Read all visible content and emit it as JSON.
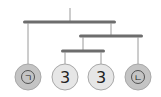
{
  "diagram": {
    "type": "hanging-mobile-balance",
    "colors": {
      "bar": "#6d6d6d",
      "string": "#9a9a9a",
      "ball_shaded": "#bfbfbf",
      "ball_light": "#e6e6e6",
      "ball_stroke": "#a8a8a8",
      "text": "#222222"
    },
    "weights": [
      {
        "label": "㉠",
        "shaded": true
      },
      {
        "label": "3",
        "shaded": false
      },
      {
        "label": "3",
        "shaded": false
      },
      {
        "label": "㉡",
        "shaded": true
      }
    ]
  }
}
